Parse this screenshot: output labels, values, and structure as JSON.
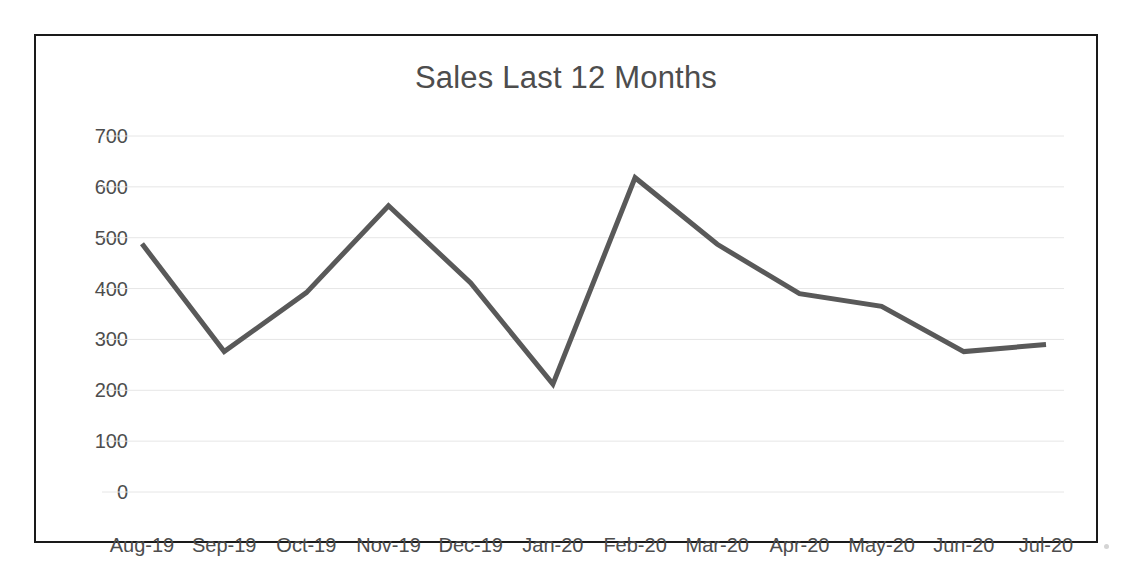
{
  "chart_data": {
    "type": "line",
    "title": "Sales Last 12 Months",
    "xlabel": "",
    "ylabel": "",
    "categories": [
      "Aug-19",
      "Sep-19",
      "Oct-19",
      "Nov-19",
      "Dec-19",
      "Jan-20",
      "Feb-20",
      "Mar-20",
      "Apr-20",
      "May-20",
      "Jun-20",
      "Jul-20"
    ],
    "values": [
      488,
      276,
      392,
      563,
      411,
      212,
      618,
      487,
      390,
      365,
      276,
      290
    ],
    "series": [
      {
        "name": "Sales",
        "values": [
          488,
          276,
          392,
          563,
          411,
          212,
          618,
          487,
          390,
          365,
          276,
          290
        ]
      }
    ],
    "ylim": [
      0,
      700
    ],
    "ytick_step": 100,
    "yticks": [
      700,
      600,
      500,
      400,
      300,
      200,
      100,
      0
    ],
    "ytick_labels": [
      "700",
      "600",
      "500",
      "400",
      "300",
      "200",
      "100",
      "0"
    ],
    "grid": true,
    "grid_axis": "y",
    "legend": false,
    "legend_position": "none",
    "markers": false,
    "line_color": "#595959",
    "line_width": 5,
    "grid_color": "#e6e6e6",
    "text_color": "#4d4d4d",
    "border_color": "#1a1a1a",
    "background_color": "#ffffff"
  }
}
